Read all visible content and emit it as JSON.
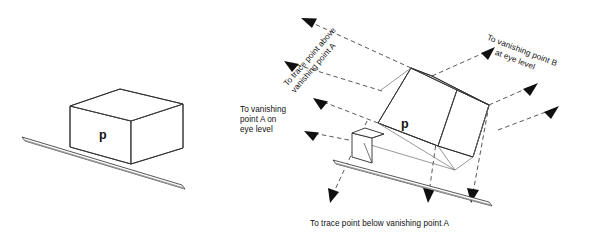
{
  "figure": {
    "background_color": "#ffffff",
    "line_color": "#2b2b2b",
    "guide_color": "#3a3a3a",
    "arrow_color": "#101010",
    "ruler_shade_color": "#9a9a9a"
  },
  "left_diagram": {
    "name": "simple-box-with-straightedge",
    "plane_letter": "p"
  },
  "right_diagram": {
    "name": "perspective-construction-box",
    "plane_letter": "p",
    "labels": {
      "trace_above": "To trace point above\nvanishing point A",
      "vanishing_b_line1": "To vanishing point B",
      "vanishing_b_line2": "at eye level",
      "vanishing_a": "To vanishing\npoint A on\neye level",
      "trace_below": "To trace point below vanishing point A"
    }
  }
}
